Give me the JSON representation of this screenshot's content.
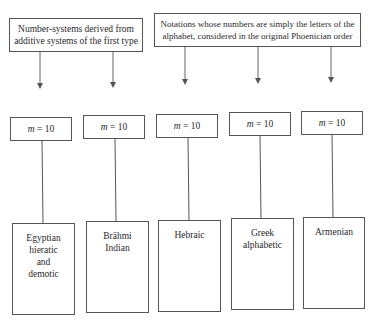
{
  "diagram": {
    "groups": [
      {
        "label_lines": [
          "Number-systems derived from",
          "additive systems of the first type"
        ]
      },
      {
        "label_lines": [
          "Notations whose numbers are simply the letters of the",
          "alphabet, considered in the original Phoenician order"
        ]
      }
    ],
    "base_label": {
      "var": "m",
      "eq": " = 10"
    },
    "nodes": [
      {
        "base": "m = 10",
        "name_lines": [
          "Egyptian",
          "hieratic",
          "and",
          "demotic"
        ],
        "group": 0
      },
      {
        "base": "m = 10",
        "name_lines": [
          "Brāhmi",
          "Indian"
        ],
        "group": 0
      },
      {
        "base": "m = 10",
        "name_lines": [
          "Hebraic"
        ],
        "group": 1
      },
      {
        "base": "m = 10",
        "name_lines": [
          "Greek",
          "alphabetic"
        ],
        "group": 1
      },
      {
        "base": "m = 10",
        "name_lines": [
          "Armenian"
        ],
        "group": 1
      }
    ],
    "colors": {
      "stroke": "#555555",
      "text": "#2a2a2a",
      "background": "#ffffff"
    }
  }
}
